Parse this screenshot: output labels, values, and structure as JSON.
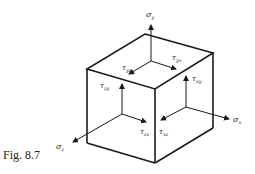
{
  "figure": {
    "caption": "Fig. 8.7"
  },
  "labels": {
    "sigma_y": {
      "sym": "σ",
      "sub": "y"
    },
    "sigma_x": {
      "sym": "σ",
      "sub": "x"
    },
    "sigma_z": {
      "sym": "σ",
      "sub": "z"
    },
    "tau_yz_top_left": {
      "sym": "τ",
      "sub": "yz"
    },
    "tau_yx_top_right": {
      "sym": "τ",
      "sub": "yx"
    },
    "tau_zy_front": {
      "sym": "τ",
      "sub": "zy"
    },
    "tau_xy_right": {
      "sym": "τ",
      "sub": "xy"
    },
    "tau_zx_front": {
      "sym": "τ",
      "sub": "zx"
    },
    "tau_xz_right": {
      "sym": "τ",
      "sub": "xz"
    }
  },
  "colors": {
    "stroke": "#1a1a1a",
    "background": "#ffffff"
  }
}
